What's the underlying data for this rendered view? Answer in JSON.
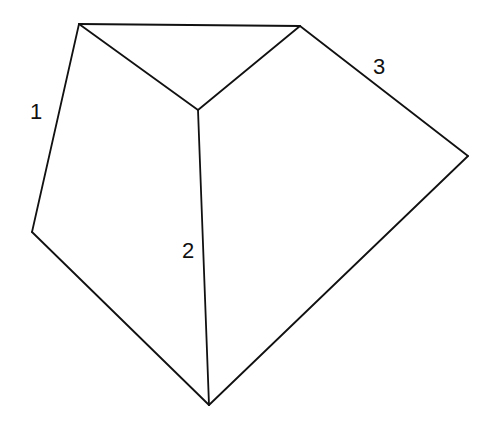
{
  "diagram": {
    "type": "polyhedron-net-sketch",
    "stroke_color": "#111111",
    "background": "#ffffff",
    "vertices": {
      "A": [
        79,
        24
      ],
      "B": [
        300,
        26
      ],
      "C": [
        198,
        110
      ],
      "D": [
        468,
        156
      ],
      "E": [
        32,
        232
      ],
      "F": [
        209,
        405
      ]
    },
    "edges": [
      [
        "A",
        "B"
      ],
      [
        "A",
        "C"
      ],
      [
        "B",
        "C"
      ],
      [
        "B",
        "D"
      ],
      [
        "A",
        "E"
      ],
      [
        "C",
        "F"
      ],
      [
        "E",
        "F"
      ],
      [
        "D",
        "F"
      ]
    ],
    "labels": [
      {
        "text": "1",
        "x": 36,
        "y": 112,
        "edge": "A-E"
      },
      {
        "text": "2",
        "x": 188,
        "y": 251,
        "edge": "C-F"
      },
      {
        "text": "3",
        "x": 379,
        "y": 67,
        "edge": "B-D"
      }
    ]
  }
}
